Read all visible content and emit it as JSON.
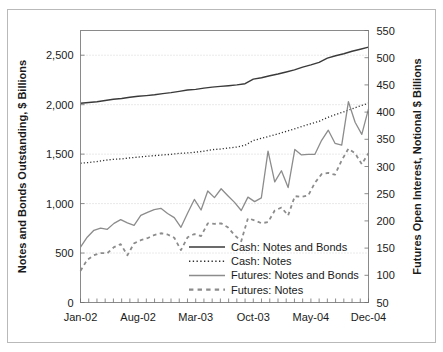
{
  "figure": {
    "border_color": "#b9b9b9",
    "background": "#ffffff"
  },
  "chart_data": {
    "type": "line",
    "title": "",
    "xlabel": "",
    "ylabel": "Notes and Bonds Outstanding, $ Billions",
    "y2label": "Futures Open Interest, Notional $ Billions",
    "grid": true,
    "legend_position": "inside-lower-right",
    "ylim": [
      0,
      2750
    ],
    "y2lim": [
      50,
      550
    ],
    "yticks": [
      "0",
      "500",
      "1,000",
      "1,500",
      "2,000",
      "2,500"
    ],
    "ytick_values": [
      0,
      500,
      1000,
      1500,
      2000,
      2500
    ],
    "y2ticks": [
      "50",
      "100",
      "150",
      "200",
      "250",
      "300",
      "350",
      "400",
      "450",
      "500",
      "550"
    ],
    "y2tick_values": [
      50,
      100,
      150,
      200,
      250,
      300,
      350,
      400,
      450,
      500,
      550
    ],
    "xticks": [
      "Jan-02",
      "Aug-02",
      "Mar-03",
      "Oct-03",
      "May-04",
      "Dec-04"
    ],
    "xtick_indices": [
      0,
      7,
      14,
      21,
      28,
      35
    ],
    "x": [
      "Jan-02",
      "Feb-02",
      "Mar-02",
      "Apr-02",
      "May-02",
      "Jun-02",
      "Jul-02",
      "Aug-02",
      "Sep-02",
      "Oct-02",
      "Nov-02",
      "Dec-02",
      "Jan-03",
      "Feb-03",
      "Mar-03",
      "Apr-03",
      "May-03",
      "Jun-03",
      "Jul-03",
      "Aug-03",
      "Sep-03",
      "Oct-03",
      "Nov-03",
      "Dec-03",
      "Jan-04",
      "Feb-04",
      "Mar-04",
      "Apr-04",
      "May-04",
      "Jun-04",
      "Jul-04",
      "Aug-04",
      "Sep-04",
      "Oct-04",
      "Nov-04",
      "Dec-04"
    ],
    "series": [
      {
        "name": "Cash: Notes and Bonds",
        "axis": "left",
        "style": "solid",
        "color": "#3a3a3a",
        "width": 1.4,
        "values": [
          2015,
          2022,
          2030,
          2042,
          2055,
          2062,
          2075,
          2085,
          2092,
          2100,
          2112,
          2122,
          2135,
          2148,
          2155,
          2168,
          2178,
          2185,
          2192,
          2200,
          2212,
          2258,
          2272,
          2292,
          2310,
          2330,
          2352,
          2380,
          2402,
          2428,
          2470,
          2495,
          2515,
          2540,
          2560,
          2582
        ]
      },
      {
        "name": "Cash: Notes",
        "axis": "left",
        "style": "dotted",
        "color": "#2e2e2e",
        "width": 1.3,
        "values": [
          1408,
          1415,
          1425,
          1438,
          1448,
          1452,
          1462,
          1470,
          1478,
          1485,
          1492,
          1498,
          1508,
          1512,
          1520,
          1530,
          1545,
          1552,
          1562,
          1572,
          1590,
          1638,
          1660,
          1682,
          1705,
          1730,
          1755,
          1782,
          1808,
          1832,
          1870,
          1900,
          1928,
          1958,
          1988,
          2015
        ]
      },
      {
        "name": "Futures: Notes and Bonds",
        "axis": "right",
        "style": "solid",
        "color": "#8c8c8c",
        "width": 1.3,
        "values_left_scale": [
          560,
          660,
          730,
          752,
          740,
          800,
          838,
          805,
          780,
          880,
          912,
          940,
          952,
          900,
          858,
          760,
          905,
          1042,
          935,
          1128,
          1060,
          1150,
          1080,
          1012,
          930,
          1065,
          1020,
          1058,
          1530,
          1220,
          1332,
          1162,
          1548,
          1492,
          1498,
          1498
        ]
      },
      {
        "name": "Futures: Notes",
        "axis": "right",
        "style": "dashed",
        "color": "#8c8c8c",
        "width": 1.8,
        "values_left_scale": [
          320,
          432,
          478,
          500,
          498,
          560,
          590,
          478,
          598,
          630,
          650,
          682,
          700,
          688,
          655,
          530,
          660,
          692,
          672,
          800,
          795,
          800,
          760,
          682,
          620,
          852,
          830,
          802,
          812,
          930,
          960,
          880,
          1075,
          1068,
          1082,
          1210
        ]
      }
    ],
    "series_tail": {
      "Futures: Notes and Bonds": [
        1498,
        1640,
        1742,
        1610,
        1592,
        2030,
        1822,
        1700,
        1958
      ],
      "Futures: Notes": [
        1210,
        1298,
        1310,
        1292,
        1438,
        1555,
        1508,
        1398,
        1510
      ]
    },
    "legend": [
      {
        "label": "Cash: Notes and Bonds",
        "style": "solid",
        "color": "#3a3a3a",
        "width": 1.6
      },
      {
        "label": "Cash: Notes",
        "style": "dotted",
        "color": "#2e2e2e",
        "width": 1.5
      },
      {
        "label": "Futures: Notes and Bonds",
        "style": "solid",
        "color": "#8c8c8c",
        "width": 1.5
      },
      {
        "label": "Futures: Notes",
        "style": "dashed",
        "color": "#8c8c8c",
        "width": 2.2
      }
    ]
  }
}
